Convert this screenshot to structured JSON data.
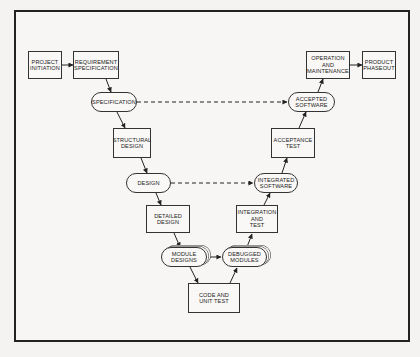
{
  "diagram": {
    "type": "software-lifecycle-v-model",
    "nodes": [
      {
        "id": "project_initiation",
        "label": "PROJECT\nINITIATION",
        "shape": "box"
      },
      {
        "id": "requirement_specification",
        "label": "REQUIREMENT\nSPECIFICATION",
        "shape": "box"
      },
      {
        "id": "specification",
        "label": "SPECIFICATION",
        "shape": "rounded"
      },
      {
        "id": "structural_design",
        "label": "STRUCTURAL\nDESIGN",
        "shape": "box"
      },
      {
        "id": "design",
        "label": "DESIGN",
        "shape": "rounded"
      },
      {
        "id": "detailed_design",
        "label": "DETAILED\nDESIGN",
        "shape": "box"
      },
      {
        "id": "module_designs",
        "label": "MODULE\nDESIGNS",
        "shape": "rounded-stack"
      },
      {
        "id": "code_and_unit_test",
        "label": "CODE AND\nUNIT TEST",
        "shape": "box"
      },
      {
        "id": "debugged_modules",
        "label": "DEBUGGED\nMODULES",
        "shape": "rounded-stack"
      },
      {
        "id": "integration_and_test",
        "label": "INTEGRATION\nAND\nTEST",
        "shape": "box"
      },
      {
        "id": "integrated_software",
        "label": "INTEGRATED\nSOFTWARE",
        "shape": "rounded"
      },
      {
        "id": "acceptance_test",
        "label": "ACCEPTANCE\nTEST",
        "shape": "box"
      },
      {
        "id": "accepted_software",
        "label": "ACCEPTED\nSOFTWARE",
        "shape": "rounded"
      },
      {
        "id": "operation_and_maintenance",
        "label": "OPERATION\nAND\nMAINTENANCE",
        "shape": "box"
      },
      {
        "id": "product_phaseout",
        "label": "PRODUCT\nPHASEOUT",
        "shape": "box"
      }
    ],
    "edges": [
      {
        "from": "project_initiation",
        "to": "requirement_specification",
        "style": "solid"
      },
      {
        "from": "requirement_specification",
        "to": "specification",
        "style": "solid"
      },
      {
        "from": "specification",
        "to": "structural_design",
        "style": "solid"
      },
      {
        "from": "structural_design",
        "to": "design",
        "style": "solid"
      },
      {
        "from": "design",
        "to": "detailed_design",
        "style": "solid"
      },
      {
        "from": "detailed_design",
        "to": "module_designs",
        "style": "solid"
      },
      {
        "from": "module_designs",
        "to": "code_and_unit_test",
        "style": "solid"
      },
      {
        "from": "code_and_unit_test",
        "to": "debugged_modules",
        "style": "solid"
      },
      {
        "from": "debugged_modules",
        "to": "integration_and_test",
        "style": "solid"
      },
      {
        "from": "integration_and_test",
        "to": "integrated_software",
        "style": "solid"
      },
      {
        "from": "integrated_software",
        "to": "acceptance_test",
        "style": "solid"
      },
      {
        "from": "acceptance_test",
        "to": "accepted_software",
        "style": "solid"
      },
      {
        "from": "accepted_software",
        "to": "operation_and_maintenance",
        "style": "solid"
      },
      {
        "from": "operation_and_maintenance",
        "to": "product_phaseout",
        "style": "solid"
      },
      {
        "from": "specification",
        "to": "accepted_software",
        "style": "dashed",
        "bidirectional": true
      },
      {
        "from": "design",
        "to": "integrated_software",
        "style": "dashed",
        "bidirectional": true
      },
      {
        "from": "module_designs",
        "to": "debugged_modules",
        "style": "solid",
        "bidirectional": true
      }
    ]
  },
  "labels": {
    "project_initiation": "PROJECT\nINITIATION",
    "requirement_specification": "REQUIREMENT\nSPECIFICATION",
    "specification": "SPECIFICATION",
    "structural_design": "STRUCTURAL\nDESIGN",
    "design": "DESIGN",
    "detailed_design": "DETAILED\nDESIGN",
    "module_designs": "MODULE\nDESIGNS",
    "code_and_unit_test": "CODE AND\nUNIT TEST",
    "debugged_modules": "DEBUGGED\nMODULES",
    "integration_and_test": "INTEGRATION\nAND\nTEST",
    "integrated_software": "INTEGRATED\nSOFTWARE",
    "acceptance_test": "ACCEPTANCE\nTEST",
    "accepted_software": "ACCEPTED\nSOFTWARE",
    "operation_and_maintenance": "OPERATION\nAND\nMAINTENANCE",
    "product_phaseout": "PRODUCT\nPHASEOUT"
  }
}
